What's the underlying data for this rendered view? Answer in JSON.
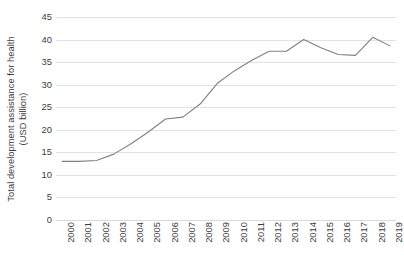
{
  "chart_data": {
    "type": "line",
    "title": "",
    "subtitle": "",
    "xlabel": "",
    "ylabel": "Total development assistance for health (USD billion)",
    "ylabel_lines": [
      "Total development assistance for health",
      "(USD billion)"
    ],
    "categories": [
      "2000",
      "2001",
      "2002",
      "2003",
      "2004",
      "2005",
      "2006",
      "2007",
      "2008",
      "2009",
      "2010",
      "2011",
      "2012",
      "2013",
      "2014",
      "2015",
      "2016",
      "2017",
      "2018",
      "2019"
    ],
    "values": [
      13.0,
      13.0,
      13.2,
      14.6,
      16.9,
      19.5,
      22.4,
      22.8,
      25.7,
      30.3,
      33.1,
      35.4,
      37.4,
      37.4,
      40.0,
      38.2,
      36.7,
      36.5,
      40.5,
      38.6
    ],
    "series": [
      {
        "name": "Total development assistance for health",
        "values": [
          13.0,
          13.0,
          13.2,
          14.6,
          16.9,
          19.5,
          22.4,
          22.8,
          25.7,
          30.3,
          33.1,
          35.4,
          37.4,
          37.4,
          40.0,
          38.2,
          36.7,
          36.5,
          40.5,
          38.6
        ]
      }
    ],
    "ylim": [
      0,
      45
    ],
    "yticks": [
      0,
      5,
      10,
      15,
      20,
      25,
      30,
      35,
      40,
      45
    ],
    "ytick_labels": [
      "0",
      "5",
      "10",
      "15",
      "20",
      "25",
      "30",
      "35",
      "40",
      "45"
    ],
    "xtick_labels": [
      "2000",
      "2001",
      "2002",
      "2003",
      "2004",
      "2005",
      "2006",
      "2007",
      "2008",
      "2009",
      "2010",
      "2011",
      "2012",
      "2013",
      "2014",
      "2015",
      "2016",
      "2017",
      "2018",
      "2019"
    ],
    "xtick_rotation": -90,
    "grid": {
      "horizontal": true,
      "vertical": false
    },
    "legend": {
      "visible": false,
      "position": "none"
    },
    "line_color": "#808080",
    "line_width": 1.1,
    "markers": false,
    "background_color": "#ffffff",
    "gridline_color": "#e2e2e2",
    "text_color": "#3d3d3d"
  }
}
